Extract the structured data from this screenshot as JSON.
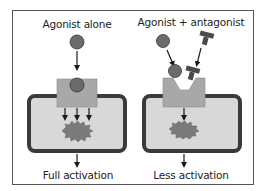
{
  "panels": [
    {
      "id": "left",
      "title": "Agonist alone",
      "result": "Full activation",
      "ligands": [
        "agonist"
      ],
      "signal_arrows": 3
    },
    {
      "id": "right",
      "title": "Agonist + antagonist",
      "result": "Less activation",
      "ligands": [
        "agonist",
        "antagonist"
      ],
      "signal_arrows": 1
    }
  ],
  "colors": {
    "agonist": "#6b6b6b",
    "antagonist": "#4a4a4a",
    "receptor": "#a8a8a8",
    "cell_fill": "#d8d8d8",
    "cell_border": "#3a3a3a",
    "effector": "#7a7a7a",
    "frame": "#555555"
  }
}
